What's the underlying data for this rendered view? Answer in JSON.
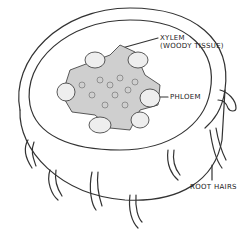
{
  "diagram": {
    "labels": {
      "xylem_line1": "XYLEM",
      "xylem_line2": "(WOODY TISSUE)",
      "phloem": "PHLOEM",
      "root_hairs": "ROOT HAIRS"
    },
    "colors": {
      "ink": "#333333",
      "background": "#ffffff"
    }
  }
}
